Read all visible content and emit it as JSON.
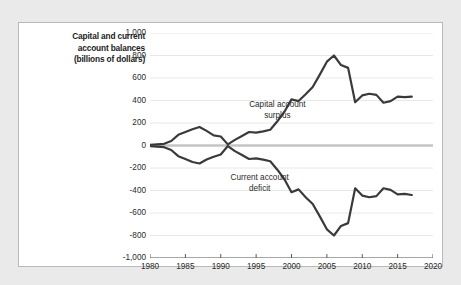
{
  "chart_data": {
    "type": "line",
    "title": "Capital and current account balances (billions of dollars)",
    "xlabel": "",
    "ylabel": "Capital and current account balances (billions of dollars)",
    "xlim": [
      1980,
      2020
    ],
    "ylim": [
      -1000,
      1000
    ],
    "grid": true,
    "legend_position": "inline-annotations",
    "x_ticks": [
      "1980",
      "1985",
      "1990",
      "1995",
      "2000",
      "2005",
      "2010",
      "2015",
      "2020"
    ],
    "y_ticks": [
      "1,000",
      "800",
      "600",
      "400",
      "200",
      "0",
      "-200",
      "-400",
      "-600",
      "-800",
      "-1,000"
    ],
    "zero_line": true,
    "x": [
      1980,
      1981,
      1982,
      1983,
      1984,
      1985,
      1986,
      1987,
      1988,
      1989,
      1990,
      1991,
      1992,
      1993,
      1994,
      1995,
      1996,
      1997,
      1998,
      1999,
      2000,
      2001,
      2002,
      2003,
      2004,
      2005,
      2006,
      2007,
      2008,
      2009,
      2010,
      2011,
      2012,
      2013,
      2014,
      2015,
      2016,
      2017
    ],
    "series": [
      {
        "name": "Capital account surplus",
        "color": "#3a3a3a",
        "values": [
          5,
          10,
          15,
          40,
          95,
          120,
          145,
          165,
          130,
          90,
          80,
          10,
          50,
          85,
          120,
          115,
          125,
          140,
          215,
          300,
          410,
          395,
          455,
          520,
          630,
          745,
          800,
          715,
          690,
          385,
          445,
          460,
          450,
          380,
          395,
          435,
          430,
          435
        ]
      },
      {
        "name": "Current account deficit",
        "color": "#3a3a3a",
        "values": [
          -5,
          -10,
          -15,
          -40,
          -95,
          -120,
          -147,
          -160,
          -125,
          -100,
          -80,
          -5,
          -50,
          -85,
          -120,
          -115,
          -125,
          -140,
          -215,
          -300,
          -415,
          -390,
          -460,
          -520,
          -630,
          -745,
          -800,
          -715,
          -690,
          -380,
          -445,
          -460,
          -450,
          -380,
          -395,
          -435,
          -430,
          -440
        ]
      }
    ],
    "annotations": [
      {
        "text_line1": "Capital account",
        "text_line2": "surplus",
        "x": 1998.0,
        "y": 350
      },
      {
        "text_line1": "Current account",
        "text_line2": "deficit",
        "x": 1995.5,
        "y": -300
      }
    ]
  }
}
